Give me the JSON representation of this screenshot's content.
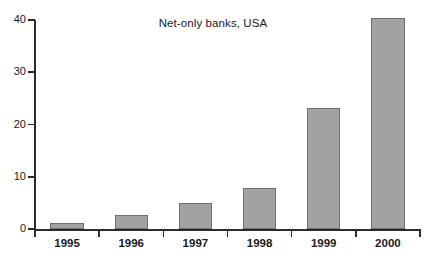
{
  "chart_data": {
    "type": "bar",
    "title": "Net-only banks, USA",
    "xlabel": "",
    "ylabel": "",
    "categories": [
      "1995",
      "1996",
      "1997",
      "1998",
      "1999",
      "2000"
    ],
    "values": [
      1.2,
      2.6,
      5.0,
      7.8,
      23.2,
      40.3
    ],
    "ylim": [
      0,
      40
    ],
    "yticks": [
      0,
      10,
      20,
      30,
      40
    ],
    "ytick_labels": [
      "0",
      "10",
      "20",
      "30",
      "40"
    ],
    "grid": false,
    "legend": false,
    "series": [
      {
        "name": "Net-only banks",
        "values": [
          1.2,
          2.6,
          5.0,
          7.8,
          23.2,
          40.3
        ]
      }
    ],
    "colors": {
      "bar_fill": "#a2a2a2",
      "bar_edge": "#6f6f6f",
      "axis": "#2b2b2b",
      "text": "#1a1a1a",
      "background": "#ffffff"
    }
  }
}
